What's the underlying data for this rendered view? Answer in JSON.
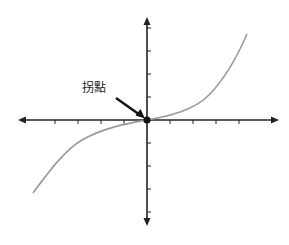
{
  "diagram": {
    "title": "",
    "annotation": {
      "text": "拐點",
      "meaning": "inflection point"
    },
    "axes": {
      "origin_px": [
        147,
        120
      ],
      "x_range_px": [
        18,
        279
      ],
      "y_range_px": [
        17,
        226
      ],
      "x_ticks_px": [
        55,
        78,
        101,
        124,
        170,
        193,
        216,
        239
      ],
      "y_ticks_px": [
        28,
        51,
        74,
        97,
        143,
        166,
        189,
        212
      ],
      "axis_color": "#222222",
      "arrowheads": "both ends"
    },
    "curve": {
      "type": "cubic-like (inflection at origin)",
      "color": "#999999",
      "points_px": [
        [
          33,
          193
        ],
        [
          55,
          165
        ],
        [
          80,
          141
        ],
        [
          110,
          128
        ],
        [
          147,
          120
        ],
        [
          180,
          112
        ],
        [
          205,
          100
        ],
        [
          225,
          78
        ],
        [
          247,
          34
        ]
      ]
    },
    "marker": {
      "at_px": [
        147,
        120
      ],
      "color": "#111111"
    },
    "arrow": {
      "from_px": [
        116,
        98
      ],
      "to_px": [
        143,
        117
      ],
      "color": "#111111"
    }
  }
}
